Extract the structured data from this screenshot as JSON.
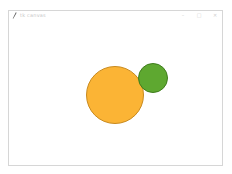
{
  "window": {
    "title": "tk canvas",
    "icon": "feather-icon",
    "controls": {
      "minimize": "–",
      "maximize": "□",
      "close": "✕"
    }
  },
  "canvas": {
    "background": "#ffffff",
    "shapes": [
      {
        "type": "circle",
        "name": "orange-circle",
        "center_x": 115,
        "center_y": 95,
        "radius": 29,
        "fill": "#fbb435",
        "stroke": "#c98a1e"
      },
      {
        "type": "circle",
        "name": "green-circle",
        "center_x": 153,
        "center_y": 78,
        "radius": 15,
        "fill": "#5ea830",
        "stroke": "#3f7d1c"
      }
    ]
  }
}
